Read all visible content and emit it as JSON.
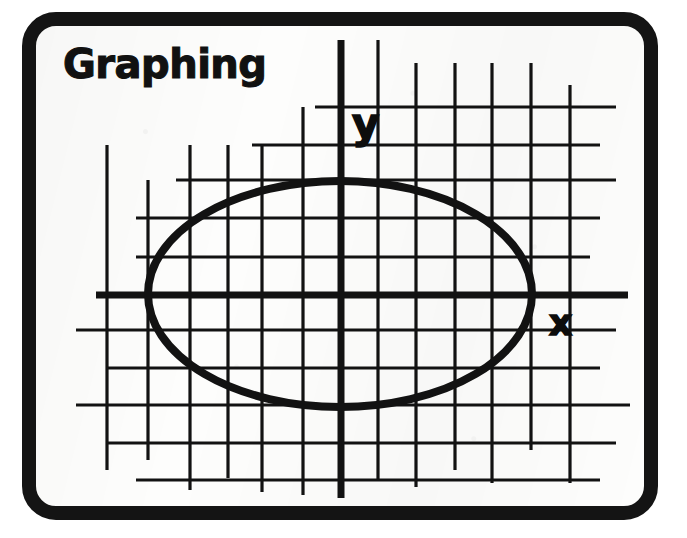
{
  "figure": {
    "title": "Graphing",
    "border_color": "#141414",
    "ink_color": "#121212",
    "paper_color": "#fdfdfc"
  },
  "axes": {
    "x_label": "x",
    "y_label": "y",
    "x_axis_y_px": 295,
    "y_axis_x_px": 341,
    "axis_stroke_width": 7
  },
  "grid": {
    "stroke_width": 3.2,
    "vertical_x": [
      107,
      148,
      190,
      228,
      262,
      303,
      341,
      378,
      416,
      455,
      492,
      531,
      570
    ],
    "horizontal_y": [
      107,
      145,
      180,
      218,
      257,
      295,
      330,
      368,
      405,
      443,
      480
    ],
    "vertical_spans": [
      [
        145,
        470
      ],
      [
        180,
        460
      ],
      [
        145,
        490
      ],
      [
        145,
        478
      ],
      [
        145,
        492
      ],
      [
        107,
        495
      ],
      [
        40,
        498
      ],
      [
        40,
        480
      ],
      [
        63,
        487
      ],
      [
        63,
        470
      ],
      [
        63,
        483
      ],
      [
        63,
        450
      ],
      [
        85,
        483
      ]
    ],
    "horizontal_spans": [
      [
        315,
        616
      ],
      [
        252,
        600
      ],
      [
        176,
        616
      ],
      [
        136,
        600
      ],
      [
        136,
        590
      ],
      [
        96,
        628
      ],
      [
        76,
        616
      ],
      [
        106,
        600
      ],
      [
        76,
        630
      ],
      [
        106,
        616
      ],
      [
        136,
        600
      ]
    ]
  },
  "chart_data": {
    "type": "scatter",
    "title": "Graphing",
    "xlabel": "x",
    "ylabel": "y",
    "grid": true,
    "legend": "none",
    "annotations": [
      "y",
      "x"
    ],
    "shapes": [
      {
        "kind": "ellipse",
        "center_px": [
          340,
          294
        ],
        "radius_x_px": 192,
        "radius_y_px": 113,
        "stroke_width": 8,
        "fill": "none",
        "description": "ellipse centered on the origin"
      }
    ]
  }
}
